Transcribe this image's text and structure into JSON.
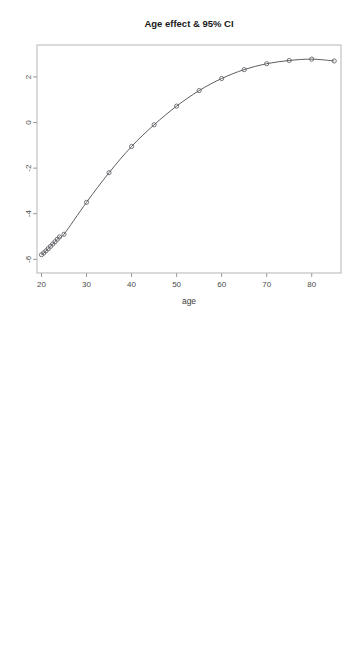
{
  "figure": {
    "width": 353,
    "height": 646,
    "background": "#ffffff",
    "panel_count": 2
  },
  "style": {
    "frame_color": "#b5b5b5",
    "line_color": "#4c4c4c",
    "ci_color": "#6e6e6e",
    "marker_color": "#55555f",
    "tick_color": "#9a9a9a",
    "text_color": "#1a1a1a"
  },
  "chart_data": [
    {
      "id": "top",
      "type": "line",
      "title": "Age effect & 95% CI",
      "xlabel": "age",
      "ylabel": "",
      "xlim": [
        19,
        86.5
      ],
      "ylim": [
        -6.6,
        3.4
      ],
      "xticks": [
        20,
        30,
        40,
        50,
        60,
        70,
        80
      ],
      "xticklabels": [
        "20",
        "30",
        "40",
        "50",
        "60",
        "70",
        "80"
      ],
      "yticks": [
        2,
        0,
        -2,
        -4,
        -6
      ],
      "yticklabels": [
        "2",
        "0",
        "-2",
        "-4",
        "-6"
      ],
      "grid": false,
      "legend": "none",
      "markers": "open-circle",
      "series": [
        {
          "name": "Age effect (fit)",
          "style": "solid",
          "show_markers": true,
          "x": [
            20,
            20.5,
            21,
            21.5,
            22,
            22.5,
            23,
            23.5,
            24,
            25,
            30,
            35,
            40,
            45,
            50,
            55,
            60,
            65,
            70,
            75,
            80,
            85
          ],
          "y": [
            -5.8,
            -5.72,
            -5.63,
            -5.53,
            -5.43,
            -5.33,
            -5.23,
            -5.12,
            -5.02,
            -4.9,
            -3.5,
            -2.2,
            -1.05,
            -0.1,
            0.72,
            1.4,
            1.93,
            2.32,
            2.58,
            2.72,
            2.78,
            2.7
          ]
        }
      ]
    },
    {
      "id": "bottom",
      "type": "line",
      "title": "Age effect & 95% CI",
      "xlabel": "age",
      "ylabel": "",
      "xlim": [
        19,
        86.5
      ],
      "ylim": [
        -9.8,
        3.6
      ],
      "xticks": [
        20,
        30,
        40,
        50,
        60,
        70,
        80
      ],
      "xticklabels": [
        "20",
        "30",
        "40",
        "50",
        "60",
        "70",
        "80"
      ],
      "yticks": [
        2,
        0,
        -2,
        -4,
        -6,
        -8
      ],
      "yticklabels": [
        "2",
        "0",
        "-2",
        "-4",
        "-6",
        "-8"
      ],
      "grid": false,
      "legend": "none",
      "markers": "open-circle",
      "series": [
        {
          "name": "Age effect (fit)",
          "style": "solid",
          "show_markers": true,
          "x": [
            20,
            25,
            30,
            35,
            40,
            45,
            50,
            55,
            60,
            65,
            70,
            75,
            80,
            85
          ],
          "y": [
            -5.8,
            -4.9,
            -3.5,
            -2.2,
            -1.05,
            -0.1,
            0.72,
            1.4,
            1.93,
            2.32,
            2.58,
            2.72,
            2.78,
            2.7
          ]
        },
        {
          "name": "Upper 95% CI",
          "style": "dotted",
          "show_markers": false,
          "x": [
            20,
            22,
            24,
            26,
            28,
            30,
            32,
            35,
            40,
            45,
            50,
            55,
            60,
            65,
            70,
            75,
            80,
            85,
            86.5
          ],
          "y": [
            -2.35,
            -2.55,
            -2.68,
            -2.7,
            -2.6,
            -2.42,
            -2.15,
            -1.6,
            -0.62,
            0.32,
            1.12,
            1.78,
            2.3,
            2.7,
            2.98,
            3.12,
            3.2,
            3.18,
            3.15
          ]
        },
        {
          "name": "Lower 95% CI",
          "style": "dotted",
          "show_markers": false,
          "x": [
            20,
            22,
            24,
            26,
            28,
            30,
            32,
            35,
            40,
            45,
            50,
            55,
            60,
            65,
            70,
            75,
            80,
            85,
            86.5
          ],
          "y": [
            -9.35,
            -8.55,
            -7.78,
            -7.0,
            -6.3,
            -5.62,
            -5.0,
            -4.15,
            -2.9,
            -1.85,
            -0.95,
            -0.2,
            0.45,
            1.0,
            1.48,
            1.85,
            2.08,
            2.18,
            2.2
          ]
        }
      ]
    }
  ]
}
